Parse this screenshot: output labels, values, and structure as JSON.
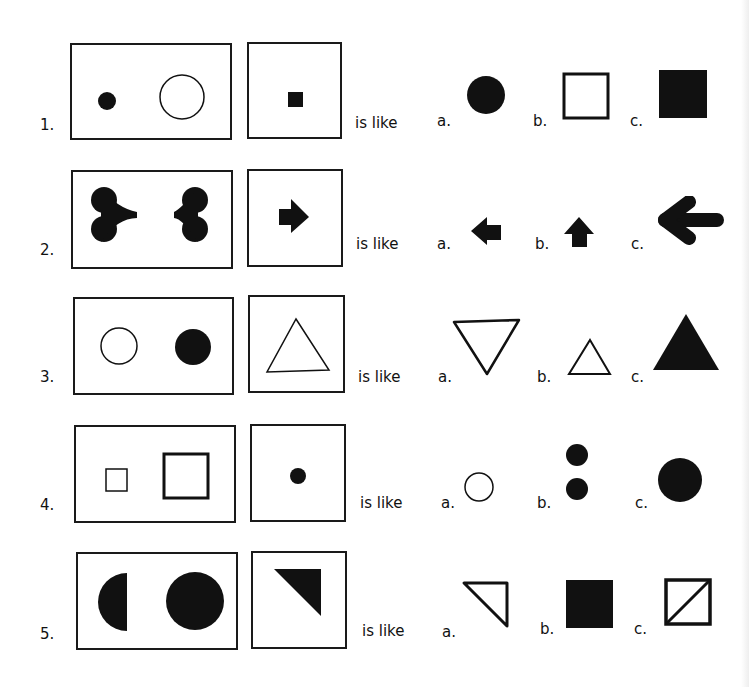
{
  "worksheet": {
    "connector_text": "is like",
    "ink_color": "#111111",
    "rows": [
      {
        "number": "1.",
        "pair": [
          "small filled circle",
          "large outline circle"
        ],
        "given": "small filled square",
        "options": [
          {
            "label": "a.",
            "shape": "filled circle"
          },
          {
            "label": "b.",
            "shape": "outline square"
          },
          {
            "label": "c.",
            "shape": "large filled square"
          }
        ]
      },
      {
        "number": "2.",
        "pair": [
          "heart shape pointing right",
          "heart shape pointing left"
        ],
        "given": "right arrow",
        "options": [
          {
            "label": "a.",
            "shape": "small left arrow"
          },
          {
            "label": "b.",
            "shape": "small up arrow"
          },
          {
            "label": "c.",
            "shape": "large left arrow"
          }
        ]
      },
      {
        "number": "3.",
        "pair": [
          "outline circle",
          "filled circle"
        ],
        "given": "outline triangle",
        "options": [
          {
            "label": "a.",
            "shape": "outline inverted triangle"
          },
          {
            "label": "b.",
            "shape": "small outline triangle"
          },
          {
            "label": "c.",
            "shape": "filled triangle"
          }
        ]
      },
      {
        "number": "4.",
        "pair": [
          "small thin square",
          "large thick square"
        ],
        "given": "small filled circle",
        "options": [
          {
            "label": "a.",
            "shape": "small outline circle"
          },
          {
            "label": "b.",
            "shape": "two filled circles"
          },
          {
            "label": "c.",
            "shape": "large filled circle"
          }
        ]
      },
      {
        "number": "5.",
        "pair": [
          "filled half circle",
          "filled circle"
        ],
        "given": "filled right triangle",
        "options": [
          {
            "label": "a.",
            "shape": "outline right triangle"
          },
          {
            "label": "b.",
            "shape": "filled square"
          },
          {
            "label": "c.",
            "shape": "square with diagonal"
          }
        ]
      }
    ]
  }
}
